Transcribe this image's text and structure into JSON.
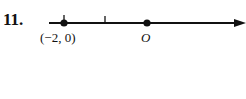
{
  "problem_number": "11.",
  "number_line": {
    "points": [
      {
        "label": "(−2, 0)",
        "x_value": -2
      },
      {
        "label": "O",
        "x_value": 0
      }
    ],
    "tick_marks": [
      -2,
      -1
    ],
    "arrow_direction": "right"
  }
}
